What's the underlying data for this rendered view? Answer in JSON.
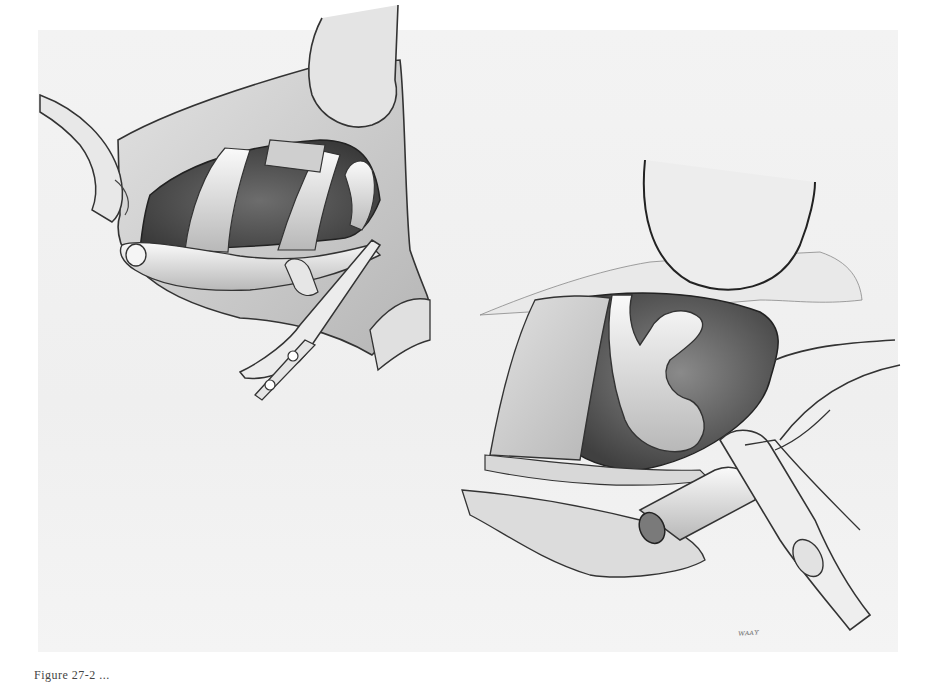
{
  "figure": {
    "panels": [
      {
        "id": "left",
        "label": "Retracted incision exposing ribs with vessel held by forceps"
      },
      {
        "id": "right",
        "label": "Retracted cavity with curved vessel divided and clamped"
      }
    ],
    "signature": "ᴡᴀᴀʏ",
    "caption": "Figure 27-2 ...",
    "colors": {
      "background": "#ffffff",
      "panel": "#f1f1f1",
      "line": "#2a2a2a",
      "shade_dark": "#555555",
      "shade_mid": "#9a9a9a",
      "shade_light": "#d6d6d6"
    }
  }
}
